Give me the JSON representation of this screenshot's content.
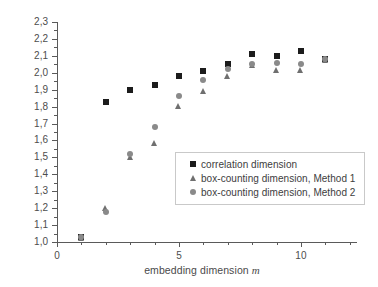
{
  "chart_data": {
    "type": "scatter",
    "title": "",
    "xlabel": "embedding dimension m",
    "ylabel": "dimensional estimate",
    "xlim": [
      0,
      12.3
    ],
    "ylim": [
      1.0,
      2.3
    ],
    "xticks": [
      0,
      5,
      10
    ],
    "xtick_labels": [
      "0",
      "5",
      "10"
    ],
    "xminor_step": 1,
    "yticks": [
      1.0,
      1.1,
      1.2,
      1.3,
      1.4,
      1.5,
      1.6,
      1.7,
      1.8,
      1.9,
      2.0,
      2.1,
      2.2,
      2.3
    ],
    "ytick_labels": [
      "1,0",
      "1,1",
      "1,2",
      "1,3",
      "1,4",
      "1,5",
      "1,6",
      "1,7",
      "1,8",
      "1,9",
      "2,0",
      "2,1",
      "2,2",
      "2,3"
    ],
    "grid": false,
    "legend_position": "lower-right",
    "x": [
      1,
      2,
      3,
      4,
      5,
      6,
      7,
      8,
      9,
      10,
      11
    ],
    "series": [
      {
        "name": "correlation dimension",
        "marker": "square",
        "color": "#1c1c1c",
        "values": [
          1.03,
          1.83,
          1.9,
          1.93,
          1.98,
          2.01,
          2.05,
          2.11,
          2.1,
          2.13,
          2.08
        ]
      },
      {
        "name": "box-counting dimension, Method 1",
        "marker": "triangle",
        "color": "#6f6f6f",
        "values": [
          1.02,
          1.2,
          1.5,
          1.58,
          1.8,
          1.89,
          1.98,
          2.04,
          2.01,
          2.01,
          2.07
        ]
      },
      {
        "name": "box-counting dimension, Method 2",
        "marker": "circle",
        "color": "#8a8a8a",
        "values": [
          1.03,
          1.18,
          1.52,
          1.68,
          1.86,
          1.96,
          2.02,
          2.05,
          2.06,
          2.05,
          2.08
        ]
      }
    ]
  },
  "legend": {
    "items": [
      {
        "label": "correlation dimension",
        "marker": "square"
      },
      {
        "label": "box-counting dimension, Method 1",
        "marker": "triangle"
      },
      {
        "label": "box-counting dimension, Method 2",
        "marker": "circle"
      }
    ]
  },
  "axes": {
    "x_title_text": "embedding dimension ",
    "x_title_symbol": "m",
    "y_title": "dimensional estimate"
  }
}
